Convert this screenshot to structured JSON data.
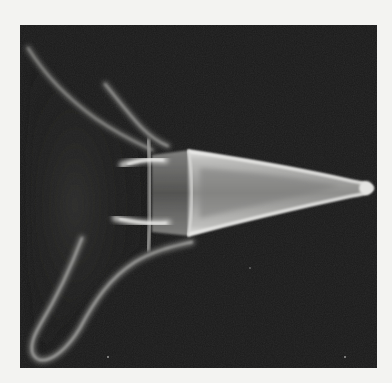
{
  "figure": {
    "kind": "grayscale photograph",
    "description": "Bright conical body pointing right with a darker collar band, two short horizontal bright bars and two curved flaring filaments sweeping to the upper-left and lower-left.",
    "colors": {
      "page_background": "#f3f3f1",
      "frame_background": "#1b1b1b",
      "cone_rim": "#e8e8e6",
      "cone_interior": "#9a9a98",
      "collar": "#5c5c5a",
      "filament": "#8a8a88"
    },
    "frame": {
      "x": 20,
      "y": 25,
      "width": 357,
      "height": 343
    }
  }
}
